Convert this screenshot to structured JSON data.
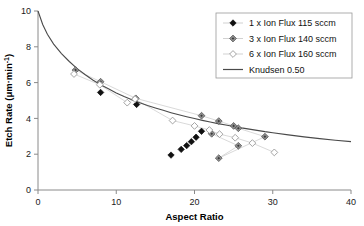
{
  "chart_data": {
    "type": "scatter",
    "title": "",
    "xlabel": "Aspect Ratio",
    "ylabel": "Etch Rate (μm·min⁻¹)",
    "ylabel_parts": {
      "main": "Etch Rate (μm·min",
      "sup": "-1",
      "tail": ")"
    },
    "xlim": [
      0,
      40
    ],
    "ylim": [
      0,
      10
    ],
    "xticks": [
      0,
      10,
      20,
      30,
      40
    ],
    "yticks": [
      0,
      2,
      4,
      6,
      8,
      10
    ],
    "grid": false,
    "legend_position": "top-right",
    "series": [
      {
        "name": "1 x Ion Flux 115 sccm",
        "marker": "filled-diamond",
        "color": "#111111",
        "connected": false,
        "points": [
          {
            "x": 8.0,
            "y": 5.45
          },
          {
            "x": 12.6,
            "y": 4.78
          },
          {
            "x": 17.0,
            "y": 1.95
          },
          {
            "x": 18.3,
            "y": 2.27
          },
          {
            "x": 19.0,
            "y": 2.48
          },
          {
            "x": 19.6,
            "y": 2.7
          },
          {
            "x": 20.2,
            "y": 2.95
          },
          {
            "x": 20.9,
            "y": 3.28
          }
        ]
      },
      {
        "name": "3 x Ion Flux 140 sccm",
        "marker": "gray-diamond",
        "color": "#8c8c8c",
        "connected": true,
        "points": [
          {
            "x": 4.8,
            "y": 6.7
          },
          {
            "x": 8.0,
            "y": 6.05
          },
          {
            "x": 12.5,
            "y": 5.12
          },
          {
            "x": 20.9,
            "y": 4.15
          },
          {
            "x": 23.1,
            "y": 3.85
          },
          {
            "x": 25.0,
            "y": 3.58
          },
          {
            "x": 25.6,
            "y": 3.45
          },
          {
            "x": 29.0,
            "y": 2.98
          },
          {
            "x": 23.1,
            "y": 1.78
          },
          {
            "x": 25.6,
            "y": 2.47
          },
          {
            "x": 22.2,
            "y": 3.14
          }
        ]
      },
      {
        "name": "6 x Ion Flux 160 sccm",
        "marker": "open-diamond",
        "color": "#8c8c8c",
        "connected": true,
        "points": [
          {
            "x": 4.6,
            "y": 6.48
          },
          {
            "x": 7.9,
            "y": 5.88
          },
          {
            "x": 11.4,
            "y": 4.88
          },
          {
            "x": 12.4,
            "y": 5.08
          },
          {
            "x": 17.2,
            "y": 3.88
          },
          {
            "x": 20.0,
            "y": 3.58
          },
          {
            "x": 21.9,
            "y": 3.35
          },
          {
            "x": 23.2,
            "y": 3.12
          },
          {
            "x": 25.2,
            "y": 2.92
          },
          {
            "x": 27.4,
            "y": 2.62
          },
          {
            "x": 30.2,
            "y": 2.1
          }
        ]
      }
    ],
    "model": {
      "name": "Knudsen 0.50",
      "marker": "line",
      "color": "#4a4a4a",
      "description": "Knudsen transport model, transmission 0.50",
      "points": [
        {
          "x": 0.0,
          "y": 10.0
        },
        {
          "x": 0.6,
          "y": 9.25
        },
        {
          "x": 1.2,
          "y": 8.7
        },
        {
          "x": 2.0,
          "y": 8.15
        },
        {
          "x": 3.0,
          "y": 7.62
        },
        {
          "x": 4.0,
          "y": 7.18
        },
        {
          "x": 5.0,
          "y": 6.78
        },
        {
          "x": 6.0,
          "y": 6.45
        },
        {
          "x": 7.0,
          "y": 6.15
        },
        {
          "x": 8.0,
          "y": 5.88
        },
        {
          "x": 9.0,
          "y": 5.65
        },
        {
          "x": 10.0,
          "y": 5.42
        },
        {
          "x": 11.0,
          "y": 5.22
        },
        {
          "x": 12.0,
          "y": 5.04
        },
        {
          "x": 13.0,
          "y": 4.88
        },
        {
          "x": 14.0,
          "y": 4.72
        },
        {
          "x": 15.0,
          "y": 4.58
        },
        {
          "x": 16.0,
          "y": 4.45
        },
        {
          "x": 17.0,
          "y": 4.32
        },
        {
          "x": 18.0,
          "y": 4.2
        },
        {
          "x": 19.0,
          "y": 4.09
        },
        {
          "x": 20.0,
          "y": 3.99
        },
        {
          "x": 21.0,
          "y": 3.89
        },
        {
          "x": 22.0,
          "y": 3.8
        },
        {
          "x": 23.0,
          "y": 3.71
        },
        {
          "x": 24.0,
          "y": 3.63
        },
        {
          "x": 25.0,
          "y": 3.55
        },
        {
          "x": 26.0,
          "y": 3.47
        },
        {
          "x": 27.0,
          "y": 3.4
        },
        {
          "x": 28.0,
          "y": 3.33
        },
        {
          "x": 29.0,
          "y": 3.26
        },
        {
          "x": 30.0,
          "y": 3.2
        },
        {
          "x": 32.0,
          "y": 3.08
        },
        {
          "x": 34.0,
          "y": 2.97
        },
        {
          "x": 36.0,
          "y": 2.87
        },
        {
          "x": 38.0,
          "y": 2.78
        },
        {
          "x": 40.0,
          "y": 2.7
        }
      ]
    },
    "legend": [
      {
        "label": "1 x Ion Flux 115 sccm",
        "marker": "filled-diamond"
      },
      {
        "label": "3 x Ion Flux 140 sccm",
        "marker": "gray-diamond"
      },
      {
        "label": "6 x Ion Flux 160 sccm",
        "marker": "open-diamond"
      },
      {
        "label": "Knudsen 0.50",
        "marker": "line"
      }
    ]
  }
}
